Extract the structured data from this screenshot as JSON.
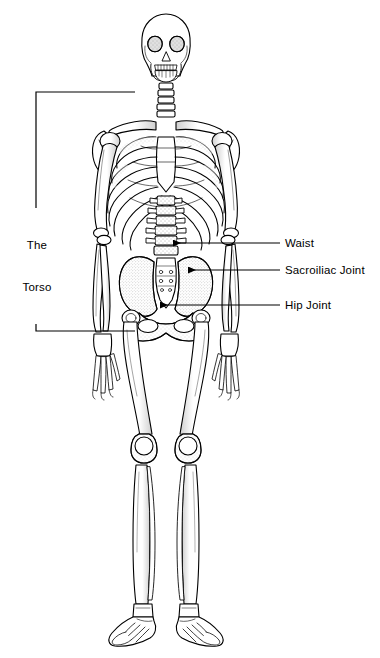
{
  "figure": {
    "name": "human-skeleton-anterior-view",
    "background_color": "#ffffff",
    "line_color": "#000000",
    "width": 380,
    "height": 658
  },
  "bracket": {
    "name": "torso-bracket",
    "label_line_1": "The",
    "label_line_2": "Torso",
    "label_full": "The Torso",
    "orientation": "left",
    "top_y": 92,
    "bottom_y": 331,
    "spine_x": 36,
    "arm_end_x": 135
  },
  "callouts": [
    {
      "id": "waist",
      "label": "Waist",
      "text_x": 285,
      "text_y": 243,
      "leader_from_x": 280,
      "leader_to_x": 173,
      "leader_y": 243,
      "arrowhead": "left"
    },
    {
      "id": "sacroiliac-joint",
      "label": "Sacroiliac Joint",
      "text_x": 285,
      "text_y": 270,
      "leader_from_x": 280,
      "leader_to_x": 188,
      "leader_y": 270,
      "arrowhead": "left"
    },
    {
      "id": "hip-joint",
      "label": "Hip Joint",
      "text_x": 285,
      "text_y": 305,
      "leader_from_x": 280,
      "leader_to_x": 160,
      "leader_y": 305,
      "arrowhead": "left"
    }
  ],
  "anatomy_parts": [
    "skull",
    "mandible",
    "cervical-vertebrae",
    "clavicle",
    "scapula",
    "sternum",
    "ribcage",
    "humerus",
    "radius",
    "ulna",
    "carpals-and-phalanges",
    "lumbar-vertebrae",
    "pelvis",
    "sacrum",
    "femur",
    "patella",
    "tibia",
    "fibula",
    "tarsals-and-metatarsals"
  ]
}
